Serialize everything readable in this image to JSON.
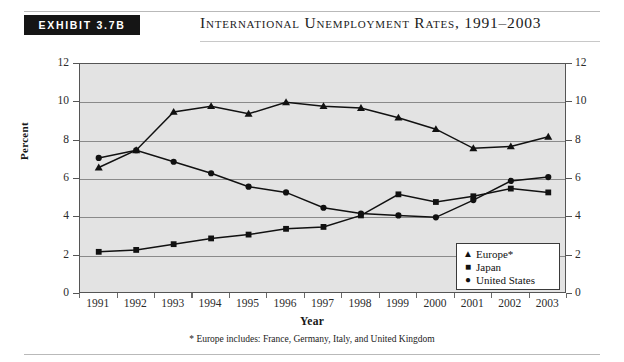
{
  "header": {
    "exhibit_label": "Exhibit 3.7B",
    "title": "International Unemployment Rates, 1991–2003"
  },
  "footnote": "* Europe includes: France, Germany, Italy, and United Kingdom",
  "legend": {
    "items": [
      {
        "marker": "▲",
        "label": "Europe*",
        "name": "europe"
      },
      {
        "marker": "■",
        "label": "Japan",
        "name": "japan"
      },
      {
        "marker": "●",
        "label": "United States",
        "name": "united-states"
      }
    ]
  },
  "axes": {
    "y_left_ticks": [
      "0",
      "2",
      "4",
      "6",
      "8",
      "10",
      "12"
    ],
    "y_right_ticks": [
      "0",
      "2",
      "4",
      "6",
      "8",
      "10",
      "12"
    ],
    "y_title": "Percent",
    "x_title": "Year",
    "x_ticks": [
      "1991",
      "1992",
      "1993",
      "1994",
      "1995",
      "1996",
      "1997",
      "1998",
      "1999",
      "2000",
      "2001",
      "2002",
      "2003"
    ]
  },
  "colors": {
    "plot_background": "#e3e3e3",
    "gridline": "#8a8a8a",
    "frame": "#555555",
    "series": "#111111",
    "badge_background": "#151515",
    "badge_text": "#ffffff"
  },
  "chart_data": {
    "type": "line",
    "title": "International Unemployment Rates, 1991–2003",
    "subtitle": "",
    "xlabel": "Year",
    "ylabel": "Percent",
    "ylim": [
      0,
      12
    ],
    "ytick_step": 2,
    "grid": true,
    "legend_position": "inside-bottom-right",
    "annotations": [
      "* Europe includes: France, Germany, Italy, and United Kingdom"
    ],
    "categories": [
      "1991",
      "1992",
      "1993",
      "1994",
      "1995",
      "1996",
      "1997",
      "1998",
      "1999",
      "2000",
      "2001",
      "2002",
      "2003"
    ],
    "series": [
      {
        "name": "Europe*",
        "marker": "triangle",
        "values": [
          6.6,
          7.5,
          9.5,
          9.8,
          9.4,
          10.0,
          9.8,
          9.7,
          9.2,
          8.6,
          7.6,
          7.7,
          8.2
        ]
      },
      {
        "name": "Japan",
        "marker": "square",
        "values": [
          2.2,
          2.3,
          2.6,
          2.9,
          3.1,
          3.4,
          3.5,
          4.1,
          5.2,
          4.8,
          5.1,
          5.5,
          5.3
        ]
      },
      {
        "name": "United States",
        "marker": "circle",
        "values": [
          7.1,
          7.5,
          6.9,
          6.3,
          5.6,
          5.3,
          4.5,
          4.2,
          4.1,
          4.0,
          4.9,
          5.9,
          6.1
        ]
      }
    ]
  }
}
